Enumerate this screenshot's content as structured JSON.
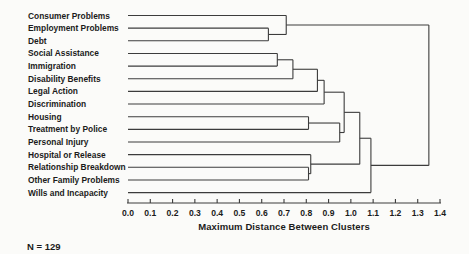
{
  "figure": {
    "note": "N = 129"
  },
  "chart_data": {
    "type": "dendrogram",
    "orientation": "horizontal-left-labels",
    "title": "",
    "xlabel": "Maximum Distance Between Clusters",
    "ylabel": "",
    "xlim": [
      0.0,
      1.4
    ],
    "x_tick_step": 0.1,
    "x_tick_labels": [
      "0.0",
      "0.1",
      "0.2",
      "0.3",
      "0.4",
      "0.5",
      "0.6",
      "0.7",
      "0.8",
      "0.9",
      "1.0",
      "1.1",
      "1.2",
      "1.3",
      "1.4"
    ],
    "grid": "off",
    "sample_size": "N = 129",
    "leaves": [
      "Consumer Problems",
      "Employment Problems",
      "Debt",
      "Social Assistance",
      "Immigration",
      "Disability Benefits",
      "Legal Action",
      "Discrimination",
      "Housing",
      "Treatment by Police",
      "Personal Injury",
      "Hospital or Release",
      "Relationship Breakdown",
      "Other Family Problems",
      "Wills and Incapacity"
    ],
    "merges": [
      {
        "id": "M1",
        "children": [
          "Employment Problems",
          "Debt"
        ],
        "distance": 0.63
      },
      {
        "id": "M2",
        "children": [
          "Consumer Problems",
          "M1"
        ],
        "distance": 0.71
      },
      {
        "id": "M3",
        "children": [
          "Social Assistance",
          "Immigration"
        ],
        "distance": 0.67
      },
      {
        "id": "M4",
        "children": [
          "M3",
          "Disability Benefits"
        ],
        "distance": 0.74
      },
      {
        "id": "M5",
        "children": [
          "M4",
          "Legal Action"
        ],
        "distance": 0.85
      },
      {
        "id": "M6",
        "children": [
          "M5",
          "Discrimination"
        ],
        "distance": 0.88
      },
      {
        "id": "M7",
        "children": [
          "Housing",
          "Treatment by Police"
        ],
        "distance": 0.81
      },
      {
        "id": "M8",
        "children": [
          "M7",
          "Personal Injury"
        ],
        "distance": 0.95
      },
      {
        "id": "M9",
        "children": [
          "M6",
          "M8"
        ],
        "distance": 0.97
      },
      {
        "id": "M10",
        "children": [
          "Relationship Breakdown",
          "Other Family Problems"
        ],
        "distance": 0.81
      },
      {
        "id": "M11",
        "children": [
          "Hospital or Release",
          "M10"
        ],
        "distance": 0.82
      },
      {
        "id": "M12",
        "children": [
          "M9",
          "M11"
        ],
        "distance": 1.04
      },
      {
        "id": "M13",
        "children": [
          "M12",
          "Wills and Incapacity"
        ],
        "distance": 1.09
      },
      {
        "id": "M14",
        "children": [
          "M2",
          "M13"
        ],
        "distance": 1.35
      }
    ],
    "line_color": "#3c3c3c",
    "text_color": "#1b1b1b",
    "background_color": "#fbfbf9"
  }
}
